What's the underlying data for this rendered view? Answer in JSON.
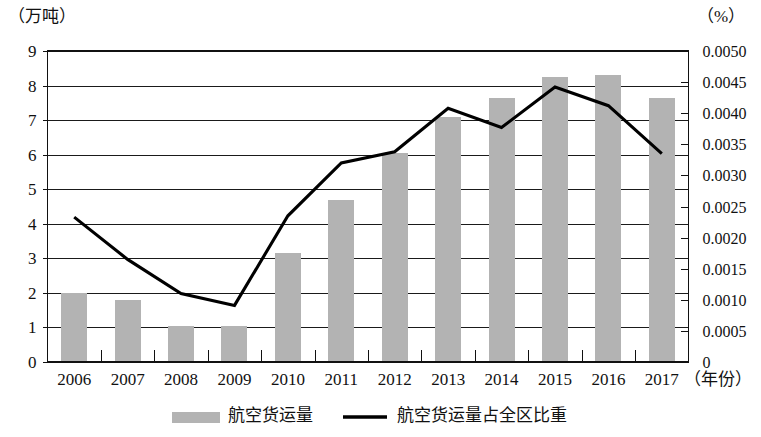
{
  "chart_data": {
    "type": "bar",
    "title": "",
    "subtitle": "",
    "categories": [
      "2006",
      "2007",
      "2008",
      "2009",
      "2010",
      "2011",
      "2012",
      "2013",
      "2014",
      "2015",
      "2016",
      "2017"
    ],
    "xlabel": "（年份）",
    "ylabel": "（万吨）",
    "y2label": "（%）",
    "ylim": [
      0,
      9
    ],
    "y2lim": [
      0,
      0.005
    ],
    "yticks": [
      "0",
      "1",
      "2",
      "3",
      "4",
      "5",
      "6",
      "7",
      "8",
      "9"
    ],
    "ytick_values": [
      0,
      1,
      2,
      3,
      4,
      5,
      6,
      7,
      8,
      9
    ],
    "y2ticks": [
      "0",
      "0.0005",
      "0.0010",
      "0.0015",
      "0.0020",
      "0.0025",
      "0.0030",
      "0.0035",
      "0.0040",
      "0.0045",
      "0.0050"
    ],
    "y2tick_values": [
      0,
      0.0005,
      0.001,
      0.0015,
      0.002,
      0.0025,
      0.003,
      0.0035,
      0.004,
      0.0045,
      0.005
    ],
    "grid": true,
    "legend_position": "bottom",
    "series": [
      {
        "name": "航空货运量",
        "type": "bar",
        "axis": "left",
        "color": "#b3b3b3",
        "values": [
          2.0,
          1.8,
          1.05,
          1.05,
          3.15,
          4.7,
          6.05,
          7.1,
          7.65,
          8.25,
          8.3,
          7.65
        ]
      },
      {
        "name": "航空货运量占全区比重",
        "type": "line",
        "axis": "right",
        "color": "#000000",
        "values": [
          0.00233,
          0.00165,
          0.0011,
          0.00091,
          0.00235,
          0.0032,
          0.00338,
          0.00408,
          0.00377,
          0.00442,
          0.00412,
          0.00335
        ]
      }
    ]
  },
  "legend": {
    "items": [
      {
        "label": "航空货运量",
        "marker": "swatch",
        "color": "#b3b3b3"
      },
      {
        "label": "航空货运量占全区比重",
        "marker": "line",
        "color": "#000000"
      }
    ]
  }
}
